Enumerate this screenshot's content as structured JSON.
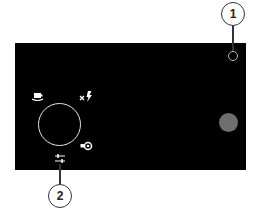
{
  "camera_screen": {
    "background": "#000000",
    "front_camera_indicator": {
      "icon": "front-camera-ring-icon"
    },
    "mode_dial": {
      "icon": "circular-dial-ring"
    },
    "camera_switch": {
      "icon": "switch-camera-icon"
    },
    "flash": {
      "icon": "flash-off-icon",
      "state": "off"
    },
    "video_mode": {
      "icon": "video-record-icon"
    },
    "settings": {
      "icon": "sliders-icon"
    },
    "shutter_button": {
      "icon": "shutter-button",
      "color": "#6e6e6e"
    }
  },
  "callouts": [
    {
      "number": "1"
    },
    {
      "number": "2"
    }
  ]
}
